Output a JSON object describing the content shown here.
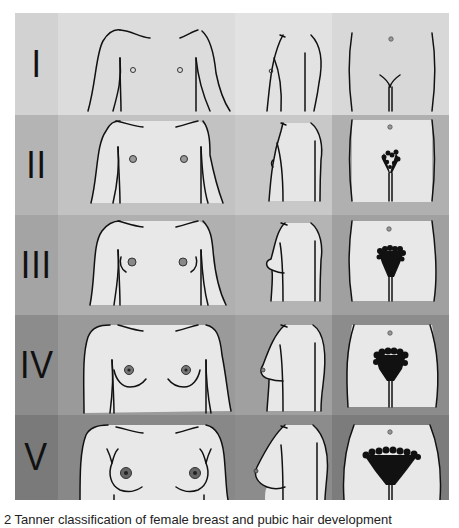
{
  "figure": {
    "caption": "2 Tanner classification of female breast and pubic hair development",
    "columns": [
      "Breast (front view)",
      "Breast (side view)",
      "Pubic hair"
    ],
    "rows": [
      {
        "stage": "I",
        "label_bg": "#d2d2d2",
        "front_bg": "#dcdcdc",
        "side_bg": "#e2e2e2",
        "pubic_bg": "#d8d8d8",
        "body_fill": "#dcdcdc"
      },
      {
        "stage": "II",
        "label_bg": "#b4b4b4",
        "front_bg": "#c2c2c2",
        "side_bg": "#c8c8c8",
        "pubic_bg": "#b0b0b0",
        "body_fill": "#e6e6e6"
      },
      {
        "stage": "III",
        "label_bg": "#a4a4a4",
        "front_bg": "#b0b0b0",
        "side_bg": "#b4b4b4",
        "pubic_bg": "#a0a0a0",
        "body_fill": "#e8e8e8"
      },
      {
        "stage": "IV",
        "label_bg": "#8c8c8c",
        "front_bg": "#9a9a9a",
        "side_bg": "#a0a0a0",
        "pubic_bg": "#8c8c8c",
        "body_fill": "#e8e8e8"
      },
      {
        "stage": "V",
        "label_bg": "#7a7a7a",
        "front_bg": "#888888",
        "side_bg": "#8c8c8c",
        "pubic_bg": "#7c7c7c",
        "body_fill": "#e8e8e8"
      }
    ]
  }
}
